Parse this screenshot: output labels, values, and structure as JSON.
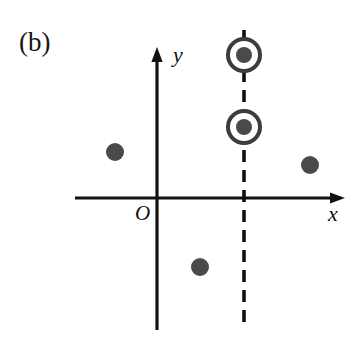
{
  "figure": {
    "panel_label": "(b)",
    "origin_label": "O",
    "x_axis_label": "x",
    "y_axis_label": "y",
    "background_color": "#ffffff",
    "axis_color": "#111111",
    "marker_color": "#4a4a4a",
    "ring_color": "#3c3c3c",
    "dashed_line_color": "#111111"
  },
  "chart_data": {
    "type": "scatter",
    "title": "(b)",
    "xlabel": "x",
    "ylabel": "y",
    "grid": false,
    "legend": null,
    "annotations": [
      {
        "text": "O",
        "role": "origin-marker",
        "px": [
          138,
          210
        ]
      },
      {
        "text": "(b)",
        "role": "panel-label",
        "px": [
          19,
          29
        ]
      }
    ],
    "axes": {
      "origin_px": [
        157,
        198
      ],
      "x_axis": {
        "start_px": [
          75,
          198
        ],
        "end_px": [
          345,
          198
        ],
        "arrow": "end",
        "style": "solid"
      },
      "y_axis": {
        "start_px": [
          157,
          330
        ],
        "end_px": [
          157,
          48
        ],
        "arrow": "end",
        "style": "solid"
      }
    },
    "reference_line": {
      "orientation": "vertical",
      "style": "dashed",
      "x_px": 244,
      "y_start_px": 30,
      "y_end_px": 330,
      "dash_length_px": 12,
      "gap_length_px": 8
    },
    "series": [
      {
        "name": "points",
        "marker": "filled-dot",
        "radius_px": 9,
        "color": "#4a4a4a",
        "points_px": [
          {
            "x": 115,
            "y": 152,
            "quadrant": "upper-left"
          },
          {
            "x": 310,
            "y": 165,
            "quadrant": "upper-right"
          },
          {
            "x": 200,
            "y": 267,
            "quadrant": "lower-right"
          }
        ]
      },
      {
        "name": "circled-points",
        "marker": "dot-in-ring",
        "radius_px": 8,
        "ring_outer_radius_px": 18,
        "ring_stroke_px": 4,
        "color": "#4a4a4a",
        "ring_color": "#3c3c3c",
        "on_reference_line": true,
        "points_px": [
          {
            "x": 244,
            "y": 55,
            "quadrant": "upper-right"
          },
          {
            "x": 244,
            "y": 127,
            "quadrant": "upper-right"
          }
        ]
      }
    ]
  }
}
